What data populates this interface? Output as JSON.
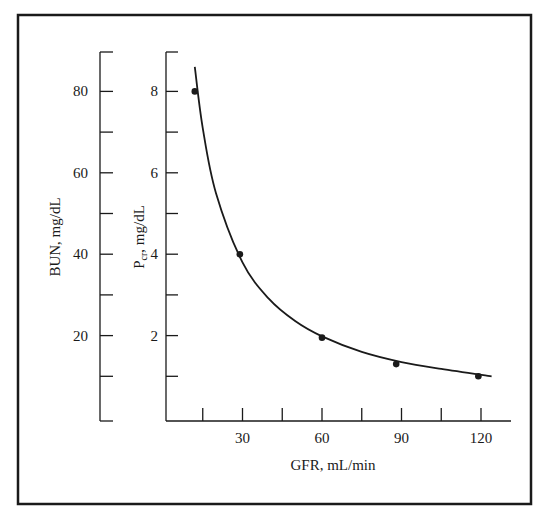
{
  "chart_data": {
    "type": "scatter",
    "title": "",
    "xlabel": "GFR, mL/min",
    "ylabel_left": "BUN, mg/dL",
    "ylabel_right": "Pcr, mg/dL",
    "ylabel_right_main": "P",
    "ylabel_right_sub": "cr",
    "ylabel_right_rest": ", mg/dL",
    "x_ticks": [
      "30",
      "60",
      "90",
      "120"
    ],
    "x_tick_values": [
      30,
      60,
      90,
      120
    ],
    "x_minor_ticks": [
      15,
      45,
      75,
      105
    ],
    "xlim": [
      0,
      130
    ],
    "bun_ticks": [
      "80",
      "60",
      "40",
      "20"
    ],
    "bun_tick_values": [
      80,
      60,
      40,
      20
    ],
    "bun_minor_ticks": [
      90,
      70,
      50,
      30,
      10,
      0
    ],
    "bun_ylim": [
      0,
      90
    ],
    "pcr_ticks": [
      "8",
      "6",
      "4",
      "2"
    ],
    "pcr_tick_values": [
      8,
      6,
      4,
      2
    ],
    "pcr_minor_ticks": [
      9,
      7,
      5,
      3,
      1
    ],
    "pcr_ylim": [
      0,
      9
    ],
    "grid": false,
    "legend": "none",
    "series": [
      {
        "name": "Measured Pcr",
        "kind": "points",
        "x": [
          12,
          29,
          60,
          88,
          119
        ],
        "y": [
          8.0,
          4.0,
          1.95,
          1.3,
          1.0
        ]
      },
      {
        "name": "Fitted hyperbola (Pcr ∝ 1/GFR)",
        "kind": "line",
        "x": [
          12,
          15,
          20,
          30,
          40,
          50,
          60,
          75,
          90,
          105,
          124
        ],
        "y": [
          8.6,
          7.1,
          5.5,
          3.8,
          2.9,
          2.35,
          1.98,
          1.6,
          1.35,
          1.18,
          1.0
        ]
      }
    ]
  }
}
